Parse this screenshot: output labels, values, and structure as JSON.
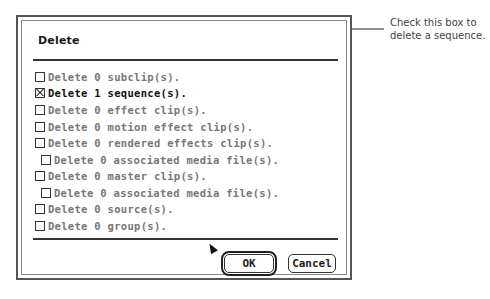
{
  "dialog": {
    "title": "Delete",
    "options": [
      {
        "label": "Delete 0 subclip(s).",
        "checked": false,
        "indent": 0
      },
      {
        "label": "Delete 1 sequence(s).",
        "checked": true,
        "indent": 0
      },
      {
        "label": "Delete 0 effect clip(s).",
        "checked": false,
        "indent": 0
      },
      {
        "label": "Delete 0 motion effect clip(s).",
        "checked": false,
        "indent": 0
      },
      {
        "label": "Delete 0 rendered effects clip(s).",
        "checked": false,
        "indent": 0
      },
      {
        "label": "Delete 0 associated media file(s).",
        "checked": false,
        "indent": 1
      },
      {
        "label": "Delete 0 master clip(s).",
        "checked": false,
        "indent": 0
      },
      {
        "label": "Delete 0 associated media file(s).",
        "checked": false,
        "indent": 1
      },
      {
        "label": "Delete 0 source(s).",
        "checked": false,
        "indent": 0
      },
      {
        "label": "Delete 0 group(s).",
        "checked": false,
        "indent": 0
      }
    ],
    "ok_label": "OK",
    "cancel_label": "Cancel"
  },
  "callout": {
    "line1": "Check this box to",
    "line2": "delete a sequence."
  }
}
